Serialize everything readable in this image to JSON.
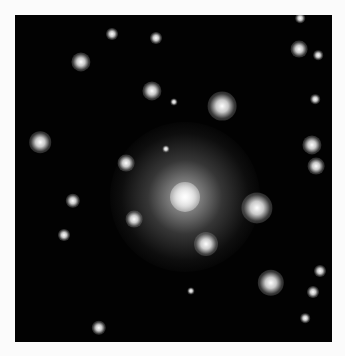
{
  "image": {
    "subject": "galaxy cluster",
    "background": "#020202",
    "page_background": "#fbfbfb"
  },
  "central_galaxy": {
    "x": 185,
    "y": 197
  },
  "sources": [
    {
      "x": 112,
      "y": 34,
      "r": 5
    },
    {
      "x": 156,
      "y": 38,
      "r": 5
    },
    {
      "x": 300,
      "y": 18,
      "r": 4
    },
    {
      "x": 81,
      "y": 62,
      "r": 8
    },
    {
      "x": 299,
      "y": 49,
      "r": 7
    },
    {
      "x": 318,
      "y": 55,
      "r": 4
    },
    {
      "x": 152,
      "y": 91,
      "r": 8
    },
    {
      "x": 222,
      "y": 106,
      "r": 12
    },
    {
      "x": 174,
      "y": 102,
      "r": 3
    },
    {
      "x": 315,
      "y": 99,
      "r": 4
    },
    {
      "x": 40,
      "y": 142,
      "r": 9
    },
    {
      "x": 312,
      "y": 145,
      "r": 8
    },
    {
      "x": 316,
      "y": 166,
      "r": 7
    },
    {
      "x": 126,
      "y": 163,
      "r": 7
    },
    {
      "x": 166,
      "y": 149,
      "r": 3
    },
    {
      "x": 73,
      "y": 201,
      "r": 6
    },
    {
      "x": 257,
      "y": 208,
      "r": 13
    },
    {
      "x": 134,
      "y": 219,
      "r": 7
    },
    {
      "x": 64,
      "y": 235,
      "r": 5
    },
    {
      "x": 206,
      "y": 244,
      "r": 10
    },
    {
      "x": 271,
      "y": 283,
      "r": 11
    },
    {
      "x": 320,
      "y": 271,
      "r": 5
    },
    {
      "x": 313,
      "y": 292,
      "r": 5
    },
    {
      "x": 305,
      "y": 318,
      "r": 4
    },
    {
      "x": 191,
      "y": 291,
      "r": 3
    },
    {
      "x": 99,
      "y": 328,
      "r": 6
    }
  ]
}
